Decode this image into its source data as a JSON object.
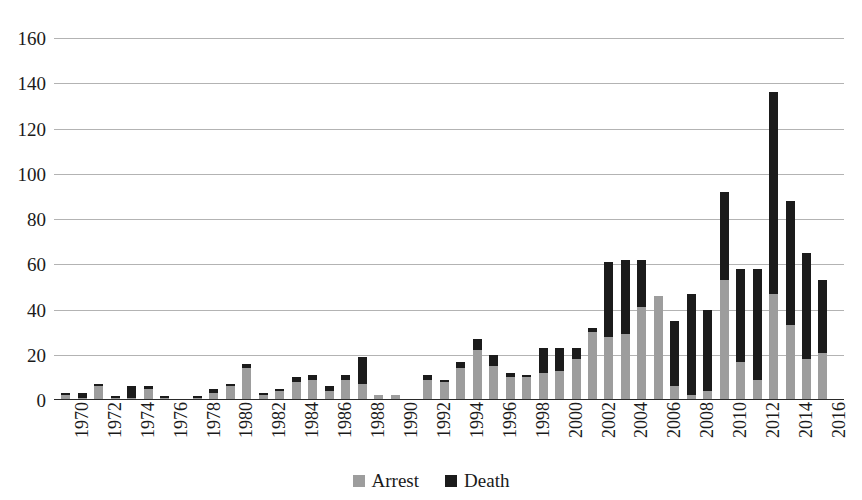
{
  "chart_data": {
    "type": "bar",
    "stacked": true,
    "title": "",
    "subtitle": "",
    "xlabel": "",
    "ylabel": "",
    "ylim": [
      0,
      160
    ],
    "ytick_step": 20,
    "grid": true,
    "legend_position": "bottom",
    "yticks": [
      "160",
      "140",
      "120",
      "100",
      "80",
      "60",
      "40",
      "20",
      "0"
    ],
    "xtick_labels": [
      "1970",
      "1972",
      "1974",
      "1976",
      "1978",
      "1980",
      "1982",
      "1984",
      "1986",
      "1988",
      "1990",
      "1992",
      "1994",
      "1996",
      "1998",
      "2000",
      "2002",
      "2004",
      "2006",
      "2008",
      "2010",
      "2012",
      "2014",
      "2016"
    ],
    "categories": [
      1970,
      1971,
      1972,
      1973,
      1974,
      1975,
      1976,
      1977,
      1978,
      1979,
      1980,
      1981,
      1982,
      1983,
      1984,
      1985,
      1986,
      1987,
      1988,
      1989,
      1990,
      1991,
      1992,
      1993,
      1994,
      1995,
      1996,
      1997,
      1998,
      1999,
      2000,
      2001,
      2002,
      2003,
      2004,
      2005,
      2006,
      2007,
      2008,
      2009,
      2010,
      2011,
      2012,
      2013,
      2014,
      2015,
      2016
    ],
    "series": [
      {
        "name": "Arrest",
        "color": "#9d9d9d",
        "values": [
          2,
          1,
          6,
          1,
          1,
          5,
          1,
          0,
          1,
          3,
          6,
          14,
          2,
          4,
          8,
          9,
          4,
          9,
          7,
          2,
          2,
          0,
          9,
          8,
          14,
          22,
          15,
          10,
          10,
          12,
          13,
          18,
          30,
          28,
          29,
          41,
          46,
          6,
          2,
          4,
          53,
          17,
          9,
          47,
          33,
          18,
          21
        ]
      },
      {
        "name": "Death",
        "color": "#1b1b1b",
        "values": [
          1,
          2,
          1,
          1,
          5,
          1,
          1,
          0,
          1,
          2,
          1,
          2,
          1,
          1,
          2,
          2,
          2,
          2,
          12,
          0,
          0,
          0,
          2,
          1,
          3,
          5,
          5,
          2,
          1,
          11,
          10,
          5,
          2,
          33,
          33,
          21,
          0,
          29,
          45,
          36,
          39,
          41,
          49,
          89,
          55,
          47,
          32
        ]
      }
    ],
    "totals": [
      3,
      3,
      7,
      2,
      6,
      6,
      2,
      0,
      2,
      5,
      7,
      16,
      3,
      5,
      10,
      11,
      6,
      11,
      19,
      2,
      2,
      0,
      11,
      9,
      17,
      27,
      20,
      12,
      11,
      23,
      23,
      23,
      32,
      61,
      62,
      62,
      46,
      35,
      47,
      40,
      92,
      58,
      58,
      136,
      88,
      65,
      53
    ]
  },
  "legend": {
    "items": [
      {
        "label": "Arrest",
        "color": "#9d9d9d"
      },
      {
        "label": "Death",
        "color": "#1b1b1b"
      }
    ]
  }
}
